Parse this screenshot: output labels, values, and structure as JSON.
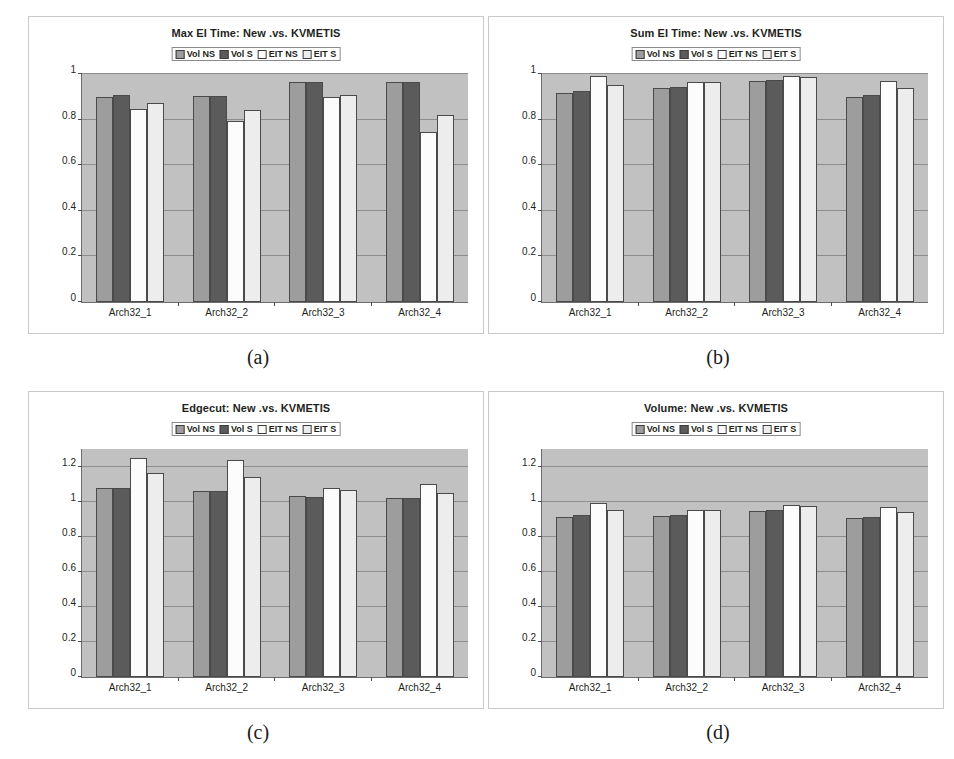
{
  "figure": {
    "series_names": [
      "Vol NS",
      "Vol S",
      "EIT NS",
      "EIT S"
    ],
    "series_colors": [
      "#9d9d9d",
      "#5b5b5b",
      "#fcfcfc",
      "#ededed"
    ],
    "categories": [
      "Arch32_1",
      "Arch32_2",
      "Arch32_3",
      "Arch32_4"
    ],
    "captions": {
      "a": "(a)",
      "b": "(b)",
      "c": "(c)",
      "d": "(d)"
    },
    "plot_bg": "#c1c1c1",
    "axis_color": "#6d6d6d"
  },
  "chart_data": [
    {
      "id": "a",
      "type": "bar",
      "title": "Max EI Time: New .vs. KVMETIS",
      "xlabel": "",
      "ylabel": "",
      "ylim": [
        0,
        1
      ],
      "yticks": [
        "0",
        "0.2",
        "0.4",
        "0.6",
        "0.8",
        "1"
      ],
      "ytick_values": [
        0,
        0.2,
        0.4,
        0.6,
        0.8,
        1
      ],
      "grid": true,
      "legend": "top-center",
      "categories": [
        "Arch32_1",
        "Arch32_2",
        "Arch32_3",
        "Arch32_4"
      ],
      "series": [
        {
          "name": "Vol NS",
          "values": [
            0.9,
            0.905,
            0.965,
            0.965
          ]
        },
        {
          "name": "Vol S",
          "values": [
            0.91,
            0.905,
            0.965,
            0.965
          ]
        },
        {
          "name": "EIT NS",
          "values": [
            0.845,
            0.795,
            0.9,
            0.745
          ]
        },
        {
          "name": "EIT S",
          "values": [
            0.875,
            0.84,
            0.91,
            0.82
          ]
        }
      ]
    },
    {
      "id": "b",
      "type": "bar",
      "title": "Sum EI Time: New .vs. KVMETIS",
      "xlabel": "",
      "ylabel": "",
      "ylim": [
        0,
        1
      ],
      "yticks": [
        "0",
        "0.2",
        "0.4",
        "0.6",
        "0.8",
        "1"
      ],
      "ytick_values": [
        0,
        0.2,
        0.4,
        0.6,
        0.8,
        1
      ],
      "grid": true,
      "legend": "top-center",
      "categories": [
        "Arch32_1",
        "Arch32_2",
        "Arch32_3",
        "Arch32_4"
      ],
      "series": [
        {
          "name": "Vol NS",
          "values": [
            0.915,
            0.94,
            0.97,
            0.9
          ]
        },
        {
          "name": "Vol S",
          "values": [
            0.925,
            0.945,
            0.975,
            0.91
          ]
        },
        {
          "name": "EIT NS",
          "values": [
            0.99,
            0.965,
            0.99,
            0.97
          ]
        },
        {
          "name": "EIT S",
          "values": [
            0.95,
            0.965,
            0.985,
            0.94
          ]
        }
      ]
    },
    {
      "id": "c",
      "type": "bar",
      "title": "Edgecut: New .vs. KVMETIS",
      "xlabel": "",
      "ylabel": "",
      "ylim": [
        0,
        1.3
      ],
      "yticks": [
        "0",
        "0.2",
        "0.4",
        "0.6",
        "0.8",
        "1",
        "1.2"
      ],
      "ytick_values": [
        0,
        0.2,
        0.4,
        0.6,
        0.8,
        1,
        1.2
      ],
      "grid": true,
      "legend": "top-center",
      "categories": [
        "Arch32_1",
        "Arch32_2",
        "Arch32_3",
        "Arch32_4"
      ],
      "series": [
        {
          "name": "Vol NS",
          "values": [
            1.08,
            1.06,
            1.03,
            1.02
          ]
        },
        {
          "name": "Vol S",
          "values": [
            1.075,
            1.06,
            1.025,
            1.02
          ]
        },
        {
          "name": "EIT NS",
          "values": [
            1.25,
            1.235,
            1.08,
            1.1
          ]
        },
        {
          "name": "EIT S",
          "values": [
            1.165,
            1.14,
            1.065,
            1.05
          ]
        }
      ]
    },
    {
      "id": "d",
      "type": "bar",
      "title": "Volume: New .vs. KVMETIS",
      "xlabel": "",
      "ylabel": "",
      "ylim": [
        0,
        1.3
      ],
      "yticks": [
        "0",
        "0.2",
        "0.4",
        "0.6",
        "0.8",
        "1",
        "1.2"
      ],
      "ytick_values": [
        0,
        0.2,
        0.4,
        0.6,
        0.8,
        1,
        1.2
      ],
      "grid": true,
      "legend": "top-center",
      "categories": [
        "Arch32_1",
        "Arch32_2",
        "Arch32_3",
        "Arch32_4"
      ],
      "series": [
        {
          "name": "Vol NS",
          "values": [
            0.915,
            0.92,
            0.945,
            0.905
          ]
        },
        {
          "name": "Vol S",
          "values": [
            0.925,
            0.925,
            0.95,
            0.915
          ]
        },
        {
          "name": "EIT NS",
          "values": [
            0.99,
            0.95,
            0.98,
            0.97
          ]
        },
        {
          "name": "EIT S",
          "values": [
            0.95,
            0.95,
            0.975,
            0.94
          ]
        }
      ]
    }
  ]
}
